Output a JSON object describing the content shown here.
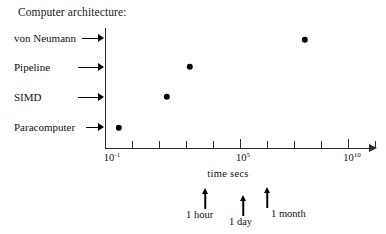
{
  "chart_data": {
    "type": "scatter",
    "title": "Computer architecture:",
    "xlabel": "time secs",
    "ylabel": "",
    "xscale": "log",
    "x_tick_labels": [
      {
        "label_base": "10",
        "label_exp": "-1",
        "value": -1,
        "major": true
      },
      {
        "label_base": "10",
        "label_exp": "5",
        "value": 5,
        "major": true
      },
      {
        "label_base": "10",
        "label_exp": "10",
        "value": 10,
        "major": true
      }
    ],
    "x_minor_ticks": [
      0,
      1,
      2,
      3,
      4,
      6,
      7,
      8,
      9
    ],
    "xlim": [
      -1,
      11
    ],
    "categories": [
      "Paracomputer",
      "SIMD",
      "Pipeline",
      "von Neumann"
    ],
    "points": [
      {
        "category": "Paracomputer",
        "x_log10_secs": 0.5,
        "px": 119,
        "py": 128
      },
      {
        "category": "SIMD",
        "x_log10_secs": 2.6,
        "px": 167,
        "py": 97
      },
      {
        "category": "Pipeline",
        "x_log10_secs": 3.7,
        "px": 190,
        "py": 67
      },
      {
        "category": "von Neumann",
        "x_log10_secs": 8.9,
        "px": 305,
        "py": 40
      }
    ],
    "annotations": [
      {
        "label": "1 hour",
        "x_log10_secs": 3.56,
        "arrow_px": 205,
        "label_px": 186,
        "label_py": 209
      },
      {
        "label": "1 day",
        "x_log10_secs": 4.94,
        "arrow_px": 243,
        "label_px": 229,
        "label_py": 216
      },
      {
        "label": "1 month",
        "x_log10_secs": 6.41,
        "arrow_px": 267,
        "label_px": 271,
        "label_py": 208
      }
    ],
    "grid": false,
    "legend": false
  },
  "y_categories": [
    {
      "label": "von Neumann",
      "label_x": 14,
      "label_y": 32,
      "arrow_x": 82,
      "arrow_y": 33,
      "arrow_w": 22
    },
    {
      "label": "Pipeline",
      "label_x": 14,
      "label_y": 61,
      "arrow_x": 78,
      "arrow_y": 62,
      "arrow_w": 26
    },
    {
      "label": "SIMD",
      "label_x": 14,
      "label_y": 91,
      "arrow_x": 78,
      "arrow_y": 92,
      "arrow_w": 26
    },
    {
      "label": "Paracomputer",
      "label_x": 14,
      "label_y": 121,
      "arrow_x": 86,
      "arrow_y": 122,
      "arrow_w": 18
    }
  ],
  "axis_tick_positions": {
    "major": [
      {
        "px": 105,
        "base": "10",
        "exp": "-1",
        "label_px": 112,
        "label_py": 152
      },
      {
        "px": 240,
        "base": "10",
        "exp": "5",
        "label_px": 243,
        "label_py": 152
      },
      {
        "px": 348,
        "base": "10",
        "exp": "10",
        "label_px": 352,
        "label_py": 152
      }
    ],
    "minor": [
      132,
      159,
      186,
      213,
      267,
      294,
      321,
      375
    ]
  },
  "axis_title_position": {
    "px": 228,
    "py": 168
  }
}
